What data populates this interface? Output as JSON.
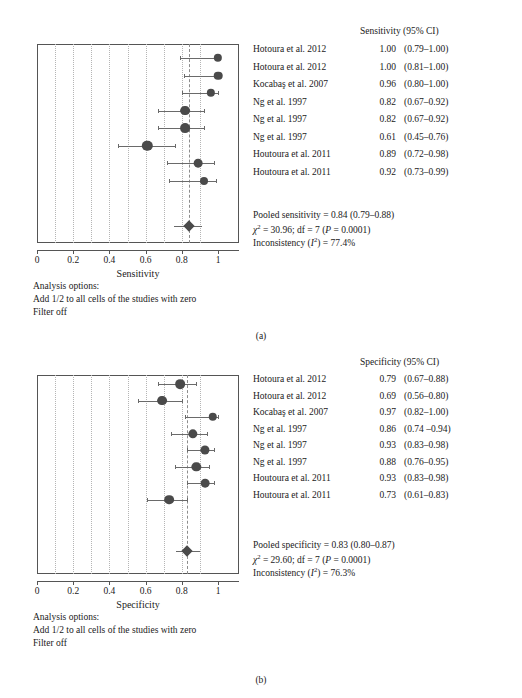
{
  "figure": {
    "panel_a_label": "(a)",
    "panel_b_label": "(b)"
  },
  "panel_a": {
    "column_header": "Sensitivity (95% CI)",
    "axis_title": "Sensitivity",
    "tick_labels": [
      "0",
      "0.2",
      "0.4",
      "0.6",
      "0.8",
      "1"
    ],
    "rows": [
      {
        "study": "Hotoura et al. 2012",
        "est": "1.00",
        "ci": "(0.79–1.00)"
      },
      {
        "study": "Hotoura et al. 2012",
        "est": "1.00",
        "ci": "(0.81–1.00)"
      },
      {
        "study": "Kocabaş et al. 2007",
        "est": "0.96",
        "ci": "(0.80–1.00)"
      },
      {
        "study": "Ng et al. 1997",
        "est": "0.82",
        "ci": "(0.67–0.92)"
      },
      {
        "study": "Ng et al. 1997",
        "est": "0.82",
        "ci": "(0.67–0.92)"
      },
      {
        "study": "Ng et al. 1997",
        "est": "0.61",
        "ci": "(0.45–0.76)"
      },
      {
        "study": "Houtoura et al. 2011",
        "est": "0.89",
        "ci": "(0.72–0.98)"
      },
      {
        "study": "Houtoura et al. 2011",
        "est": "0.92",
        "ci": "(0.73–0.99)"
      }
    ],
    "pooled_text": "Pooled sensitivity = 0.84 (0.79–0.88)",
    "chisq_text_pre": "χ",
    "chisq_text_post": " = 30.96; df = 7 (",
    "chisq_p": "P",
    "chisq_text_end": " = 0.0001)",
    "inconsistency_pre": "Inconsistency (",
    "inconsistency_i": "I",
    "inconsistency_post": ") = 77.4%",
    "analysis_options_title": "Analysis options:",
    "analysis_option_1": "Add 1/2 to all cells of the studies with zero",
    "analysis_option_2": "Filter off"
  },
  "panel_b": {
    "column_header": "Specificity (95% CI)",
    "axis_title": "Specificity",
    "tick_labels": [
      "0",
      "0.2",
      "0.4",
      "0.6",
      "0.8",
      "1"
    ],
    "rows": [
      {
        "study": "Hotoura et al. 2012",
        "est": "0.79",
        "ci": "(0.67–0.88)"
      },
      {
        "study": "Hotoura et al. 2012",
        "est": "0.69",
        "ci": "(0.56–0.80)"
      },
      {
        "study": "Kocabaş et al. 2007",
        "est": "0.97",
        "ci": "(0.82–1.00)"
      },
      {
        "study": "Ng et al. 1997",
        "est": "0.86",
        "ci": "(0.74 –0.94)"
      },
      {
        "study": "Ng et al. 1997",
        "est": "0.93",
        "ci": "(0.83–0.98)"
      },
      {
        "study": "Ng et al. 1997",
        "est": "0.88",
        "ci": "(0.76–0.95)"
      },
      {
        "study": "Houtoura et al. 2011",
        "est": "0.93",
        "ci": "(0.83–0.98)"
      },
      {
        "study": "Houtoura et al. 2011",
        "est": "0.73",
        "ci": "(0.61–0.83)"
      }
    ],
    "pooled_text": "Pooled specificity = 0.83 (0.80–0.87)",
    "chisq_text_pre": "χ",
    "chisq_text_post": " = 29.60; df = 7 (",
    "chisq_p": "P",
    "chisq_text_end": " = 0.0001)",
    "inconsistency_pre": "Inconsistency (",
    "inconsistency_i": "I",
    "inconsistency_post": ") = 76.3%",
    "analysis_options_title": "Analysis options:",
    "analysis_option_1": "Add 1/2 to all cells of the studies with zero",
    "analysis_option_2": "Filter off"
  },
  "chart_data": [
    {
      "type": "forest",
      "panel": "a",
      "title": "Sensitivity (95% CI)",
      "xlabel": "Sensitivity",
      "xlim": [
        0,
        1
      ],
      "xticks": [
        0,
        0.2,
        0.4,
        0.6,
        0.8,
        1
      ],
      "gridlines": [
        0.1,
        0.2,
        0.3,
        0.4,
        0.5,
        0.6,
        0.7,
        0.8,
        0.9
      ],
      "grid": true,
      "studies": [
        {
          "label": "Hotoura et al. 2012",
          "estimate": 1.0,
          "ci_low": 0.79,
          "ci_high": 1.0,
          "weight": 0.55
        },
        {
          "label": "Hotoura et al. 2012",
          "estimate": 1.0,
          "ci_low": 0.81,
          "ci_high": 1.0,
          "weight": 0.6
        },
        {
          "label": "Kocabaş et al. 2007",
          "estimate": 0.96,
          "ci_low": 0.8,
          "ci_high": 1.0,
          "weight": 0.55
        },
        {
          "label": "Ng et al. 1997",
          "estimate": 0.82,
          "ci_low": 0.67,
          "ci_high": 0.92,
          "weight": 0.8
        },
        {
          "label": "Ng et al. 1997",
          "estimate": 0.82,
          "ci_low": 0.67,
          "ci_high": 0.92,
          "weight": 0.8
        },
        {
          "label": "Ng et al. 1997",
          "estimate": 0.61,
          "ci_low": 0.45,
          "ci_high": 0.76,
          "weight": 0.9
        },
        {
          "label": "Houtoura et al. 2011",
          "estimate": 0.89,
          "ci_low": 0.72,
          "ci_high": 0.98,
          "weight": 0.62
        },
        {
          "label": "Houtoura et al. 2011",
          "estimate": 0.92,
          "ci_low": 0.73,
          "ci_high": 0.99,
          "weight": 0.5
        }
      ],
      "pooled": {
        "estimate": 0.84,
        "ci_low": 0.79,
        "ci_high": 0.88
      },
      "heterogeneity": {
        "chi2": 30.96,
        "df": 7,
        "p": "0.0001",
        "i_squared": "77.4%"
      }
    },
    {
      "type": "forest",
      "panel": "b",
      "title": "Specificity (95% CI)",
      "xlabel": "Specificity",
      "xlim": [
        0,
        1
      ],
      "xticks": [
        0,
        0.2,
        0.4,
        0.6,
        0.8,
        1
      ],
      "gridlines": [
        0.1,
        0.2,
        0.3,
        0.4,
        0.5,
        0.6,
        0.7,
        0.8,
        0.9
      ],
      "grid": true,
      "studies": [
        {
          "label": "Hotoura et al. 2012",
          "estimate": 0.79,
          "ci_low": 0.67,
          "ci_high": 0.88,
          "weight": 0.78
        },
        {
          "label": "Hotoura et al. 2012",
          "estimate": 0.69,
          "ci_low": 0.56,
          "ci_high": 0.8,
          "weight": 0.8
        },
        {
          "label": "Kocabaş et al. 2007",
          "estimate": 0.97,
          "ci_low": 0.82,
          "ci_high": 1.0,
          "weight": 0.58
        },
        {
          "label": "Ng et al. 1997",
          "estimate": 0.86,
          "ci_low": 0.74,
          "ci_high": 0.94,
          "weight": 0.72
        },
        {
          "label": "Ng et al. 1997",
          "estimate": 0.93,
          "ci_low": 0.83,
          "ci_high": 0.98,
          "weight": 0.68
        },
        {
          "label": "Ng et al. 1997",
          "estimate": 0.88,
          "ci_low": 0.76,
          "ci_high": 0.95,
          "weight": 0.72
        },
        {
          "label": "Houtoura et al. 2011",
          "estimate": 0.93,
          "ci_low": 0.83,
          "ci_high": 0.98,
          "weight": 0.62
        },
        {
          "label": "Houtoura et al. 2011",
          "estimate": 0.73,
          "ci_low": 0.61,
          "ci_high": 0.83,
          "weight": 0.78
        }
      ],
      "pooled": {
        "estimate": 0.83,
        "ci_low": 0.8,
        "ci_high": 0.87
      },
      "heterogeneity": {
        "chi2": 29.6,
        "df": 7,
        "p": "0.0001",
        "i_squared": "76.3%"
      }
    }
  ]
}
